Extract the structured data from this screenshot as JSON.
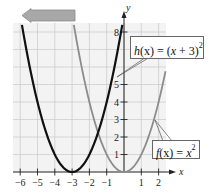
{
  "chart_data": {
    "type": "line",
    "title": "",
    "xlabel": "x",
    "ylabel": "y",
    "xlim": [
      -6.3,
      2.4
    ],
    "ylim": [
      0,
      8.5
    ],
    "grid": true,
    "x_ticks": [
      -6,
      -5,
      -4,
      -3,
      -2,
      -1,
      1,
      2
    ],
    "x_tick_labels": [
      "−6",
      "−5",
      "−4",
      "−3",
      "−2",
      "−1",
      "1",
      "2"
    ],
    "y_ticks": [
      1,
      2,
      3,
      4,
      5,
      8
    ],
    "y_tick_labels": [
      "1",
      "2",
      "3",
      "4",
      "5",
      "8"
    ],
    "series": [
      {
        "name": "h(x) = (x + 3)^2",
        "label_text": {
          "fn": "h",
          "arg": "x",
          "eq": " = (",
          "var": "x",
          "rest": " + 3)",
          "exp": "2"
        },
        "color": "#111111",
        "x": [
          -5.9,
          -5.5,
          -5,
          -4.5,
          -4,
          -3.5,
          -3,
          -2.5,
          -2,
          -1.5,
          -1,
          -0.5,
          -0.1
        ],
        "y": [
          8.41,
          6.25,
          4,
          2.25,
          1,
          0.25,
          0,
          0.25,
          1,
          2.25,
          4,
          6.25,
          8.41
        ]
      },
      {
        "name": "f(x) = x^2",
        "label_text": {
          "fn": "f",
          "arg": "x",
          "eq": " = ",
          "var": "x",
          "exp": "2"
        },
        "color": "#8c8c8c",
        "x": [
          -2.9,
          -2.5,
          -2,
          -1.5,
          -1,
          -0.5,
          0,
          0.5,
          1,
          1.5,
          2,
          2.4
        ],
        "y": [
          8.41,
          6.25,
          4,
          2.25,
          1,
          0.25,
          0,
          0.25,
          1,
          2.25,
          4,
          5.76
        ]
      }
    ],
    "annotations": [
      {
        "type": "arrow",
        "direction": "left",
        "meaning": "horizontal shift left 3 units",
        "color": "#a8a8a8"
      }
    ]
  },
  "labels": {
    "x_axis": "x",
    "y_axis": "y",
    "h_fn": "h",
    "h_arg": "(x)",
    "h_eq": " = (",
    "h_var": "x",
    "h_rest": " + 3)",
    "h_exp": "2",
    "f_fn": "f",
    "f_arg": "(x)",
    "f_eq": " = ",
    "f_var": "x",
    "f_exp": "2"
  }
}
